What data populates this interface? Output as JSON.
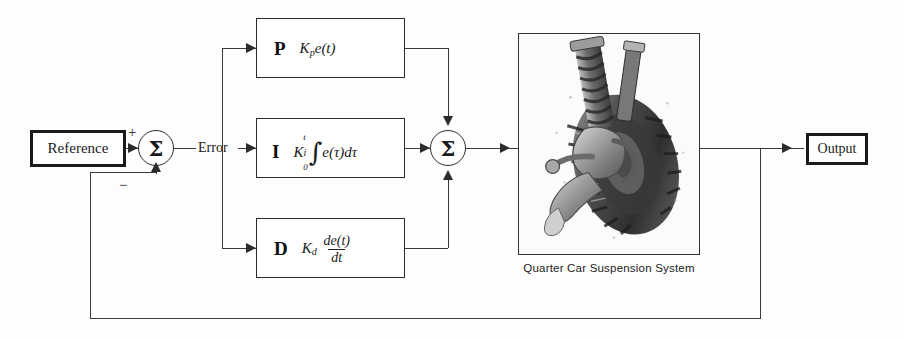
{
  "diagram": {
    "colors": {
      "line": "#3a3a3a",
      "border": "#2b2b2b",
      "text": "#1a1a1a",
      "background": "#fdfdfd"
    }
  },
  "blocks": {
    "reference": {
      "label": "Reference"
    },
    "output": {
      "label": "Output"
    },
    "proportional": {
      "letter": "P",
      "formula_plain": "K_p e(t)",
      "gain": "K",
      "gain_subscript": "p",
      "expression": "e(t)"
    },
    "integral": {
      "letter": "I",
      "formula_plain": "K_i ∫0..t e(τ) dτ",
      "gain": "K",
      "gain_subscript": "i",
      "integral_symbol": "∫",
      "limit_upper": "t",
      "limit_lower": "0",
      "expression": "e(τ)dτ"
    },
    "derivative": {
      "letter": "D",
      "formula_plain": "K_d de(t)/dt",
      "gain": "K",
      "gain_subscript": "d",
      "numerator": "de(t)",
      "denominator": "dt"
    },
    "plant": {
      "caption": "Quarter Car Suspension System",
      "alt": "grayscale photo of a car wheel and suspension strut assembly"
    }
  },
  "junctions": {
    "error_sum": {
      "symbol": "Σ",
      "plus_sign": "+",
      "minus_sign": "−"
    },
    "control_sum": {
      "symbol": "Σ"
    }
  },
  "signals": {
    "error_label": "Error"
  }
}
